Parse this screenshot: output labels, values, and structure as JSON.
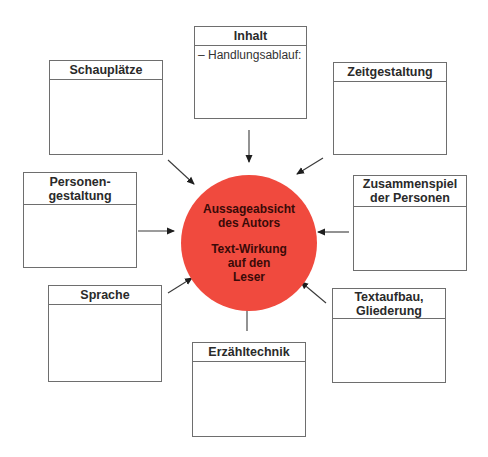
{
  "center": {
    "line1": "Aussageabsicht",
    "line2": "des Autors",
    "line3": "Text-Wirkung",
    "line4": "auf den",
    "line5": "Leser",
    "fill_color": "#f04a3e"
  },
  "boxes": {
    "inhalt": {
      "title": "Inhalt",
      "body": "– Handlungsablauf:"
    },
    "schauplaetze": {
      "title": "Schauplätze"
    },
    "zeitgestaltung": {
      "title": "Zeitgestaltung"
    },
    "personengestaltung": {
      "title_line1": "Personen-",
      "title_line2": "gestaltung"
    },
    "zusammenspiel": {
      "title_line1": "Zusammenspiel",
      "title_line2": "der Personen"
    },
    "sprache": {
      "title": "Sprache"
    },
    "textaufbau": {
      "title_line1": "Textaufbau,",
      "title_line2": "Gliederung"
    },
    "erzaehltechnik": {
      "title": "Erzähltechnik"
    }
  }
}
